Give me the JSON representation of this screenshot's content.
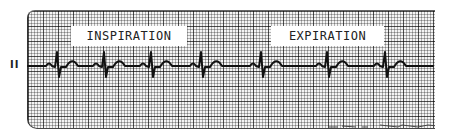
{
  "lead_label": "II",
  "annotations": {
    "inspiration": "INSPIRATION",
    "expiration": "EXPIRATION"
  },
  "strip": {
    "grid_color_major": "#555555",
    "grid_color_minor": "#9a9a9a",
    "paper_color": "#f4f4f4",
    "trace_color": "#111111"
  },
  "ecg": {
    "r_peak_x": [
      58,
      105,
      152,
      202,
      262,
      328,
      386
    ],
    "baseline_y": 66,
    "note": "Sinus arrhythmia: R-R intervals shorter during inspiration, longer during expiration"
  }
}
